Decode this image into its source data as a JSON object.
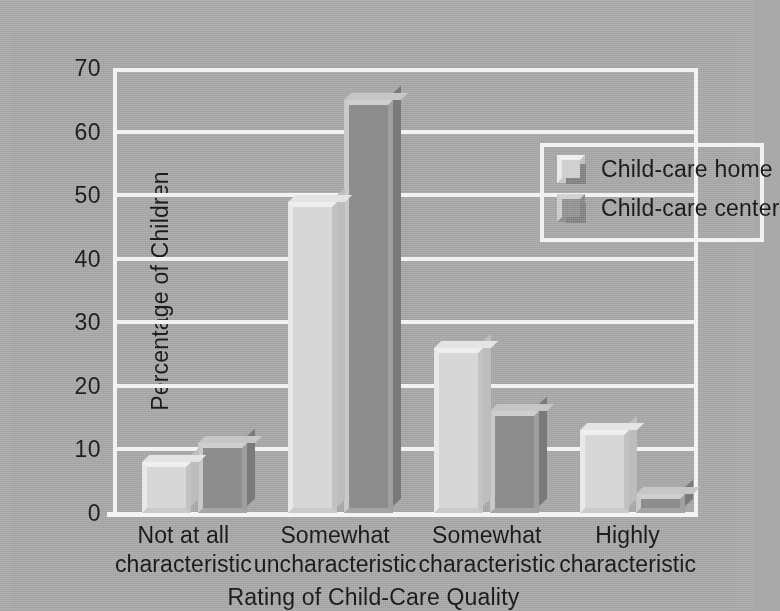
{
  "chart_data": {
    "type": "bar",
    "title": "",
    "xlabel": "Rating of Child-Care Quality",
    "ylabel": "Percentage of Children",
    "categories": [
      "Not at all\ncharacteristic",
      "Somewhat\nuncharacteristic",
      "Somewhat\ncharacteristic",
      "Highly\ncharacteristic"
    ],
    "category_lines": [
      [
        "Not at all",
        "characteristic"
      ],
      [
        "Somewhat",
        "uncharacteristic"
      ],
      [
        "Somewhat",
        "characteristic"
      ],
      [
        "Highly",
        "characteristic"
      ]
    ],
    "series": [
      {
        "name": "Child-care home",
        "values": [
          8,
          49,
          26,
          13
        ],
        "color": "#d7d7d7"
      },
      {
        "name": "Child-care center",
        "values": [
          11,
          65,
          16,
          3
        ],
        "color": "#8d8d8d"
      }
    ],
    "ylim": [
      0,
      70
    ],
    "yticks": [
      0,
      10,
      20,
      30,
      40,
      50,
      60,
      70
    ],
    "ytick_labels": [
      "0",
      "10",
      "20",
      "30",
      "40",
      "50",
      "60",
      "70"
    ],
    "grid": true,
    "grid_color": "#f2f2f2",
    "legend_position": "upper right",
    "background_color": "#a7a7a7"
  },
  "legend": {
    "entries": [
      {
        "label": "Child-care home"
      },
      {
        "label": "Child-care center"
      }
    ]
  }
}
